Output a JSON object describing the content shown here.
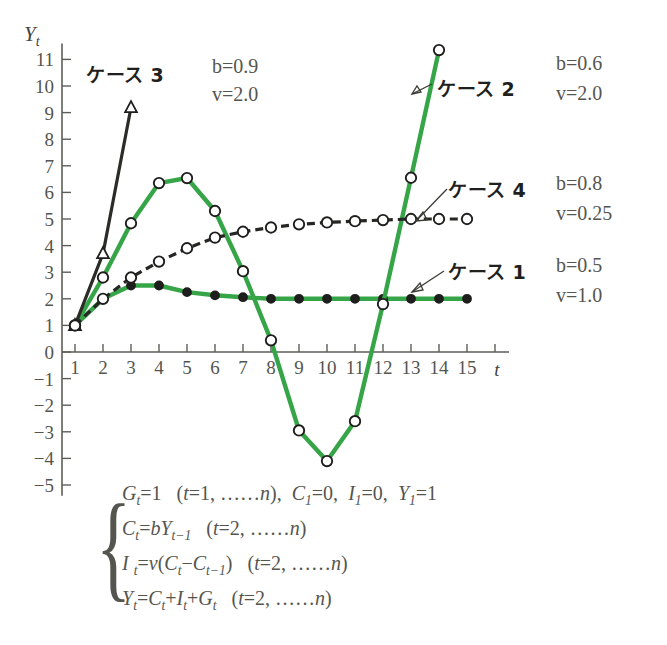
{
  "figure": {
    "y_axis_label": "Y",
    "y_axis_label_sub": "t",
    "x_axis_label": "t",
    "background": "#ffffff",
    "green": "#36a548",
    "black": "#1e1e1c"
  },
  "axes": {
    "y_ticks": [
      "11",
      "10",
      "9",
      "8",
      "7",
      "6",
      "5",
      "4",
      "3",
      "2",
      "1",
      "0",
      "-1",
      "-2",
      "-3",
      "-4",
      "-5"
    ],
    "x_ticks": [
      "1",
      "2",
      "3",
      "4",
      "5",
      "6",
      "7",
      "8",
      "9",
      "10",
      "11",
      "12",
      "13",
      "14",
      "15"
    ]
  },
  "annotations": {
    "case3": {
      "label": "ケース 3",
      "b": "b=0.9",
      "v": "v=2.0"
    },
    "case2": {
      "label": "ケース 2",
      "b": "b=0.6",
      "v": "v=2.0"
    },
    "case4": {
      "label": "ケース 4",
      "b": "b=0.8",
      "v": "v=0.25"
    },
    "case1": {
      "label": "ケース 1",
      "b": "b=0.5",
      "v": "v=1.0"
    }
  },
  "formula": {
    "line1": "G t = 1   ( t = 1, …… n ),  C 1 = 0,  I 1 = 0,  Y 1 = 1",
    "line2": "C t = bY t−1   ( t = 2, …… n )",
    "line3": "I t = v( C t − C t−1 )   ( t = 2, …… n )",
    "line4": "Y t = C t + I t + G t   ( t = 2, …… n )"
  },
  "chart_data": {
    "type": "line",
    "title": "",
    "xlabel": "t",
    "ylabel": "Y_t",
    "xlim": [
      1,
      15
    ],
    "ylim": [
      -5,
      11
    ],
    "grid": false,
    "legend": "inline-annotations",
    "x": [
      1,
      2,
      3,
      4,
      5,
      6,
      7,
      8,
      9,
      10,
      11,
      12,
      13,
      14,
      15
    ],
    "series": [
      {
        "name": "ケース 1",
        "params": {
          "b": 0.5,
          "v": 1.0
        },
        "color": "#36a548",
        "marker": "filled-circle",
        "style": "solid",
        "values": [
          1,
          2.0,
          2.5,
          2.5,
          2.25,
          2.13,
          2.06,
          2.0,
          2.0,
          2.0,
          2.0,
          2.0,
          2.0,
          2.0,
          2.0
        ]
      },
      {
        "name": "ケース 2",
        "params": {
          "b": 0.6,
          "v": 2.0
        },
        "color": "#36a548",
        "marker": "open-circle",
        "style": "solid",
        "values": [
          1,
          2.8,
          4.84,
          6.35,
          6.54,
          5.3,
          3.04,
          0.44,
          -2.95,
          -4.1,
          -2.6,
          1.8,
          6.55,
          11.35,
          null
        ]
      },
      {
        "name": "ケース 3",
        "params": {
          "b": 0.9,
          "v": 2.0
        },
        "color": "#1e1e1c",
        "marker": "triangle",
        "style": "solid",
        "values": [
          1,
          3.7,
          9.19,
          null,
          null,
          null,
          null,
          null,
          null,
          null,
          null,
          null,
          null,
          null,
          null
        ]
      },
      {
        "name": "ケース 4",
        "params": {
          "b": 0.8,
          "v": 0.25
        },
        "color": "#1e1e1c",
        "marker": "open-circle",
        "style": "dashed",
        "values": [
          1,
          2.0,
          2.8,
          3.4,
          3.9,
          4.3,
          4.52,
          4.68,
          4.8,
          4.87,
          4.92,
          4.96,
          5.0,
          5.0,
          5.0
        ]
      }
    ]
  }
}
